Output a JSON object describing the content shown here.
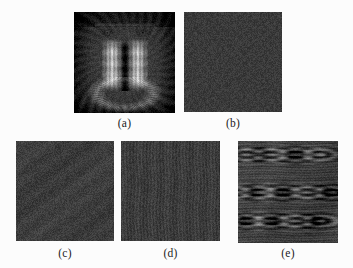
{
  "figure": {
    "background_color": "#fcfcfc",
    "width": 353,
    "height": 268,
    "panels": [
      {
        "id": "a",
        "caption": "(a)",
        "content_type": "photograph",
        "subject": "mandrill-face-grayscale",
        "description": "Grayscale photograph of a mandrill (baboon) face, frontal view, light ridged muzzle stripes centred, dark fur surround",
        "mean_gray": "#595959",
        "dark_value": "#141414",
        "light_value": "#d8d8d8"
      },
      {
        "id": "b",
        "caption": "(b)",
        "content_type": "noise-field",
        "description": "Uniform fine-grained dark noise field, no visible structure",
        "mean_gray": "#3a3a3a",
        "noise_amplitude": 22,
        "structure": "isotropic"
      },
      {
        "id": "c",
        "caption": "(c)",
        "content_type": "noise-field",
        "description": "Uniform fine-grained dark noise field with very faint residual texture",
        "mean_gray": "#3c3c3c",
        "noise_amplitude": 24,
        "structure": "isotropic"
      },
      {
        "id": "d",
        "caption": "(d)",
        "content_type": "noise-field",
        "description": "Dark noise field with subtle vertical striations",
        "mean_gray": "#3c3c3c",
        "noise_amplitude": 24,
        "structure": "vertical-striations"
      },
      {
        "id": "e",
        "caption": "(e)",
        "content_type": "interference-pattern",
        "description": "Dark field with bright horizontal moire arcs and concentric ripple bands spanning the width",
        "mean_gray": "#3f3f3f",
        "noise_amplitude": 20,
        "structure": "horizontal-moire-arcs",
        "arc_band_count": 3
      }
    ]
  }
}
